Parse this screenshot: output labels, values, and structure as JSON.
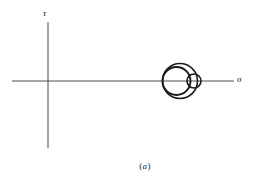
{
  "figure": {
    "caption_open": "(",
    "caption_letter": "a",
    "caption_close": ")",
    "background_color": "#ffffff",
    "stroke_color": "#1a1a1a",
    "axis_color": "#4a4a4a"
  },
  "axes": {
    "vertical_label": "τ",
    "horizontal_label": "σ",
    "vertical_label_name": "tau-axis-label",
    "horizontal_label_name": "sigma-axis-label"
  },
  "chart_data": {
    "type": "line",
    "xlabel": "σ",
    "ylabel": "τ",
    "grid": false,
    "legend": "none",
    "origin_px": {
      "x": 48,
      "y": 81
    },
    "axis_extent_px": {
      "x_start": 12,
      "x_end": 234,
      "y_top": 22,
      "y_bottom": 148
    },
    "circles": [
      {
        "name": "outer-circle",
        "label": "σ3 - σ1",
        "center_x_px": 180,
        "center_y_px": 81,
        "radius_px": 17.5,
        "left_intercept_px": 162.5,
        "right_intercept_px": 197.5
      },
      {
        "name": "left-circle",
        "label": "σ3 - σ2",
        "center_x_px": 176.5,
        "center_y_px": 81,
        "radius_px": 14,
        "left_intercept_px": 162.5,
        "right_intercept_px": 190.5
      },
      {
        "name": "right-circle",
        "label": "σ2 - σ1",
        "center_x_px": 194,
        "center_y_px": 81,
        "radius_px": 7,
        "left_intercept_px": 187,
        "right_intercept_px": 201
      }
    ],
    "principal_stress_points_px": [
      162.5,
      190.5,
      197.5
    ]
  }
}
